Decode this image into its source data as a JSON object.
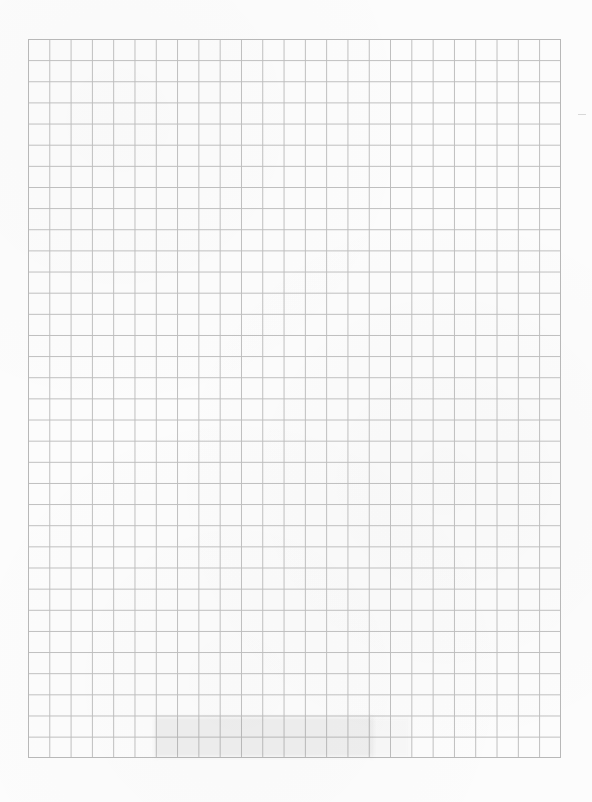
{
  "page": {
    "type": "grid-paper-scan",
    "background_color": "#fcfcfc",
    "grid_line_color": "#bdbdbd"
  },
  "grid": {
    "columns": 25,
    "rows": 34,
    "left": 28,
    "top": 39,
    "right": 561,
    "bottom": 758,
    "cell_width": 21.3,
    "cell_height": 21.15
  },
  "artifacts": {
    "bottom_smudge": {
      "x": 155,
      "y": 717,
      "width": 218,
      "height": 40
    }
  }
}
